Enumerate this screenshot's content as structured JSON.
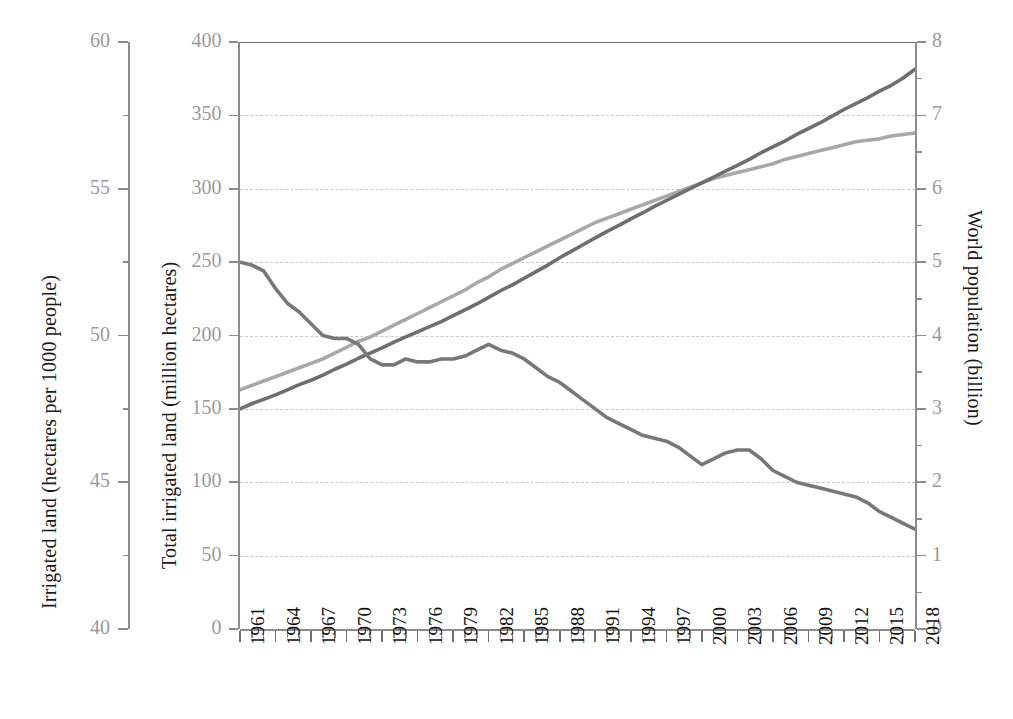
{
  "figure": {
    "background": "#ffffff",
    "plot": {
      "left": 240,
      "top": 42,
      "right": 915,
      "bottom": 629
    }
  },
  "axes": {
    "outer_left": {
      "title": "Irrigated land (hectares per 1000 people)",
      "ticks": [
        "60",
        "55",
        "50",
        "45",
        "40"
      ],
      "min": 40,
      "max": 60,
      "minor_step": 2.5,
      "color": "#9a9a9a"
    },
    "inner_left": {
      "title": "Total irrigated land (million hectares)",
      "ticks": [
        "400",
        "350",
        "300",
        "250",
        "200",
        "150",
        "100",
        "50",
        "0"
      ],
      "min": 0,
      "max": 400,
      "step": 50,
      "color": "#9a9a9a"
    },
    "right": {
      "title": "World population (billion)",
      "ticks": [
        "8",
        "7",
        "6",
        "5",
        "4",
        "3",
        "2",
        "1",
        "0"
      ],
      "min": 0,
      "max": 8,
      "step": 1,
      "minor_step": 0.5,
      "color": "#9a9a9a"
    },
    "bottom": {
      "ticks": [
        "1961",
        "1964",
        "1967",
        "1970",
        "1973",
        "1976",
        "1979",
        "1982",
        "1985",
        "1988",
        "1991",
        "1994",
        "1997",
        "2000",
        "2003",
        "2006",
        "2009",
        "2012",
        "2015",
        "2018"
      ],
      "first_year": 1961,
      "last_year": 2018,
      "tick_step_years": 3,
      "color": "#111111"
    }
  },
  "style": {
    "gridline_color": "#c9c9c9",
    "spine_color": "#8c8c8c",
    "frame_color": "#6f6f6f",
    "series_colors": {
      "irrigated_per_capita": "#787878",
      "world_population": "#6e6e6e",
      "total_irrigated_land": "#a8a8a8"
    }
  },
  "bottom_caption_fragment": "",
  "chart_data": {
    "type": "line",
    "title": "",
    "subtitle": "",
    "xlabel": "",
    "ylabel": "Total irrigated land (million hectares)",
    "y2label": "World population (billion)",
    "y3label": "Irrigated land (hectares per 1000 people)",
    "grid": true,
    "legend": "none",
    "xlim": [
      1961,
      2018
    ],
    "ylim": [
      0,
      400
    ],
    "y2lim": [
      0,
      8
    ],
    "y3lim": [
      40,
      60
    ],
    "x": [
      1961,
      1962,
      1963,
      1964,
      1965,
      1966,
      1967,
      1968,
      1969,
      1970,
      1971,
      1972,
      1973,
      1974,
      1975,
      1976,
      1977,
      1978,
      1979,
      1980,
      1981,
      1982,
      1983,
      1984,
      1985,
      1986,
      1987,
      1988,
      1989,
      1990,
      1991,
      1992,
      1993,
      1994,
      1995,
      1996,
      1997,
      1998,
      1999,
      2000,
      2001,
      2002,
      2003,
      2004,
      2005,
      2006,
      2007,
      2008,
      2009,
      2010,
      2011,
      2012,
      2013,
      2014,
      2015,
      2016,
      2017,
      2018
    ],
    "series": [
      {
        "name": "Irrigated land (hectares per 1000 people)",
        "axis": "y3",
        "unit": "hectares per 1000 people",
        "color": "#787878",
        "values": [
          52.5,
          52.4,
          52.2,
          51.6,
          51.1,
          50.8,
          50.4,
          50.0,
          49.9,
          49.9,
          49.7,
          49.2,
          49.0,
          49.0,
          49.2,
          49.1,
          49.1,
          49.2,
          49.2,
          49.3,
          49.5,
          49.7,
          49.5,
          49.4,
          49.2,
          48.9,
          48.6,
          48.4,
          48.1,
          47.8,
          47.5,
          47.2,
          47.0,
          46.8,
          46.6,
          46.5,
          46.4,
          46.2,
          45.9,
          45.6,
          45.8,
          46.0,
          46.1,
          46.1,
          45.8,
          45.4,
          45.2,
          45.0,
          44.9,
          44.8,
          44.7,
          44.6,
          44.5,
          44.3,
          44.0,
          43.8,
          43.6,
          43.4
        ]
      },
      {
        "name": "World population (billion)",
        "axis": "y2",
        "unit": "billion",
        "color": "#6e6e6e",
        "values": [
          3.0,
          3.07,
          3.13,
          3.19,
          3.26,
          3.33,
          3.39,
          3.46,
          3.54,
          3.61,
          3.69,
          3.76,
          3.83,
          3.91,
          3.98,
          4.05,
          4.12,
          4.19,
          4.27,
          4.35,
          4.43,
          4.52,
          4.61,
          4.69,
          4.78,
          4.87,
          4.96,
          5.06,
          5.15,
          5.24,
          5.33,
          5.42,
          5.5,
          5.59,
          5.67,
          5.76,
          5.84,
          5.92,
          6.0,
          6.08,
          6.16,
          6.24,
          6.32,
          6.4,
          6.49,
          6.57,
          6.65,
          6.74,
          6.82,
          6.9,
          6.99,
          7.08,
          7.16,
          7.24,
          7.33,
          7.41,
          7.51,
          7.63
        ]
      },
      {
        "name": "Total irrigated land (million hectares)",
        "axis": "y1",
        "unit": "million hectares",
        "color": "#a8a8a8",
        "values": [
          163,
          166,
          169,
          172,
          175,
          178,
          181,
          184,
          188,
          192,
          196,
          199,
          203,
          207,
          211,
          215,
          219,
          223,
          227,
          231,
          236,
          240,
          245,
          249,
          253,
          257,
          261,
          265,
          269,
          273,
          277,
          280,
          283,
          286,
          289,
          292,
          295,
          298,
          301,
          304,
          307,
          309,
          311,
          313,
          315,
          317,
          320,
          322,
          324,
          326,
          328,
          330,
          332,
          333,
          334,
          336,
          337,
          338
        ]
      }
    ]
  }
}
